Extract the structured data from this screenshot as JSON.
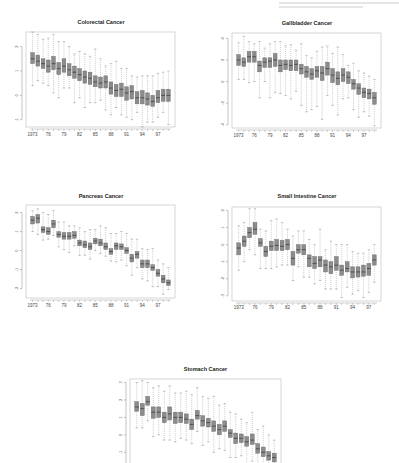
{
  "page": {
    "header_fragment": ""
  },
  "chart_data": [
    {
      "type": "boxplot",
      "title": "Colorectal Cancer",
      "categories": [
        "1973",
        "1974",
        "1975",
        "1976",
        "1977",
        "1978",
        "1979",
        "1980",
        "1981",
        "1982",
        "1983",
        "1984",
        "1985",
        "1986",
        "1987",
        "1988",
        "1989",
        "1990",
        "1991",
        "1992",
        "1993",
        "1994",
        "1995",
        "1996",
        "1997",
        "1998",
        "1999"
      ],
      "tick_labels": [
        "1973",
        "76",
        "79",
        "82",
        "85",
        "88",
        "91",
        "94",
        "97"
      ],
      "yticks": [
        -1,
        0,
        1,
        2
      ],
      "ylim": [
        -1.3,
        2.6
      ],
      "medians": [
        1.5,
        1.4,
        1.3,
        1.2,
        1.3,
        1.1,
        1.2,
        1.05,
        0.95,
        0.85,
        0.75,
        0.7,
        0.55,
        0.5,
        0.55,
        0.3,
        0.2,
        0.25,
        0.1,
        0.15,
        -0.1,
        -0.1,
        -0.15,
        -0.25,
        -0.1,
        0.0,
        0.0
      ],
      "q1": [
        1.3,
        1.2,
        1.1,
        0.95,
        1.05,
        0.85,
        0.95,
        0.8,
        0.7,
        0.6,
        0.5,
        0.45,
        0.35,
        0.3,
        0.3,
        0.05,
        -0.05,
        -0.05,
        -0.2,
        -0.15,
        -0.35,
        -0.35,
        -0.4,
        -0.45,
        -0.3,
        -0.25,
        -0.25
      ],
      "q3": [
        1.75,
        1.65,
        1.5,
        1.45,
        1.6,
        1.35,
        1.5,
        1.3,
        1.2,
        1.1,
        1.0,
        0.95,
        0.8,
        0.75,
        0.8,
        0.55,
        0.45,
        0.5,
        0.35,
        0.4,
        0.15,
        0.2,
        0.1,
        0.0,
        0.2,
        0.25,
        0.25
      ],
      "whisker_low": [
        0.4,
        0.6,
        0.5,
        0.4,
        0.1,
        -0.1,
        0.3,
        0.3,
        -0.3,
        -0.1,
        -0.5,
        -0.3,
        -0.3,
        -0.2,
        -0.6,
        -0.8,
        -0.5,
        -0.8,
        -0.9,
        -1.0,
        -0.7,
        -1.3,
        -1.1,
        -1.1,
        -0.9,
        -0.7,
        -1.2
      ],
      "whisker_high": [
        2.6,
        2.5,
        2.3,
        2.35,
        2.5,
        2.2,
        2.2,
        2.0,
        1.7,
        1.8,
        1.7,
        1.6,
        1.9,
        1.5,
        1.2,
        1.3,
        1.4,
        1.1,
        1.1,
        0.8,
        0.75,
        0.8,
        0.8,
        0.8,
        0.9,
        0.95,
        1.0
      ],
      "grid": false
    },
    {
      "type": "boxplot",
      "title": "Gallbladder Cancer",
      "categories": [
        "1973",
        "1974",
        "1975",
        "1976",
        "1977",
        "1978",
        "1979",
        "1980",
        "1981",
        "1982",
        "1983",
        "1984",
        "1985",
        "1986",
        "1987",
        "1988",
        "1989",
        "1990",
        "1991",
        "1992",
        "1993",
        "1994",
        "1995",
        "1996",
        "1997",
        "1998",
        "1999"
      ],
      "tick_labels": [
        "1973",
        "76",
        "79",
        "82",
        "85",
        "88",
        "91",
        "94",
        "97"
      ],
      "yticks": [
        -4,
        -2,
        0,
        2,
        4
      ],
      "ylim": [
        -4.3,
        4.5
      ],
      "medians": [
        2.0,
        1.8,
        2.3,
        2.3,
        1.5,
        1.8,
        1.9,
        2.0,
        1.5,
        1.6,
        1.5,
        1.6,
        1.2,
        0.9,
        0.7,
        1.0,
        0.8,
        1.2,
        0.6,
        0.3,
        0.6,
        0.4,
        -0.2,
        -0.6,
        -1.0,
        -1.1,
        -1.5
      ],
      "q1": [
        1.5,
        1.4,
        1.8,
        1.8,
        0.9,
        1.3,
        1.3,
        1.4,
        0.9,
        1.1,
        1.0,
        1.0,
        0.7,
        0.4,
        0.2,
        0.4,
        0.1,
        0.6,
        -0.1,
        -0.3,
        0.0,
        -0.2,
        -0.7,
        -1.2,
        -1.5,
        -1.6,
        -2.1
      ],
      "q3": [
        2.5,
        2.2,
        2.8,
        2.8,
        1.9,
        2.2,
        2.2,
        2.6,
        2.0,
        2.0,
        2.0,
        2.0,
        1.6,
        1.4,
        1.2,
        1.4,
        1.4,
        1.8,
        1.2,
        0.9,
        1.2,
        0.9,
        0.2,
        -0.2,
        -0.6,
        -0.7,
        -1.0
      ],
      "whisker_low": [
        0.2,
        0.2,
        -0.1,
        0.0,
        -1.5,
        0.0,
        -1.5,
        -1.0,
        -1.1,
        -1.3,
        -1.6,
        -0.9,
        -2.2,
        -2.8,
        -2.6,
        -2.3,
        -3.5,
        -1.3,
        -2.2,
        -3.1,
        -1.6,
        -1.5,
        -2.6,
        -3.3,
        -2.8,
        -3.2,
        -4.1
      ],
      "whisker_high": [
        3.6,
        4.2,
        3.7,
        3.5,
        3.7,
        3.1,
        3.5,
        3.7,
        3.7,
        3.3,
        3.4,
        2.9,
        3.5,
        2.4,
        2.2,
        2.8,
        3.2,
        3.3,
        2.6,
        3.2,
        2.5,
        1.5,
        1.7,
        1.0,
        0.8,
        0.5,
        0.2
      ],
      "grid": false
    },
    {
      "type": "boxplot",
      "title": "Pancreas Cancer",
      "categories": [
        "1973",
        "1974",
        "1975",
        "1976",
        "1977",
        "1978",
        "1979",
        "1980",
        "1981",
        "1982",
        "1983",
        "1984",
        "1985",
        "1986",
        "1987",
        "1988",
        "1989",
        "1990",
        "1991",
        "1992",
        "1993",
        "1994",
        "1995",
        "1996",
        "1997",
        "1998",
        "1999"
      ],
      "tick_labels": [
        "1973",
        "76",
        "79",
        "82",
        "85",
        "88",
        "91",
        "94",
        "97"
      ],
      "yticks": [
        -2,
        -1,
        0,
        1,
        2
      ],
      "ylim": [
        -2.5,
        2.4
      ],
      "medians": [
        1.6,
        1.7,
        1.1,
        1.0,
        1.4,
        0.85,
        0.75,
        0.75,
        0.8,
        0.4,
        0.3,
        0.2,
        0.5,
        0.4,
        0.2,
        -0.05,
        0.25,
        0.2,
        0.0,
        -0.4,
        -0.2,
        -0.7,
        -0.7,
        -0.9,
        -1.2,
        -1.5,
        -1.7
      ],
      "q1": [
        1.4,
        1.45,
        0.95,
        0.85,
        1.2,
        0.7,
        0.6,
        0.6,
        0.65,
        0.25,
        0.15,
        0.05,
        0.35,
        0.25,
        0.05,
        -0.2,
        0.05,
        0.05,
        -0.15,
        -0.6,
        -0.4,
        -0.9,
        -0.9,
        -1.05,
        -1.35,
        -1.7,
        -1.85
      ],
      "q3": [
        1.8,
        1.9,
        1.25,
        1.2,
        1.6,
        1.0,
        0.95,
        0.95,
        1.0,
        0.55,
        0.5,
        0.4,
        0.65,
        0.6,
        0.4,
        0.1,
        0.4,
        0.35,
        0.15,
        -0.2,
        -0.05,
        -0.5,
        -0.5,
        -0.75,
        -1.0,
        -1.3,
        -1.55
      ],
      "whisker_low": [
        1.0,
        0.85,
        0.55,
        0.6,
        0.8,
        0.2,
        0.05,
        -0.1,
        0.25,
        -0.25,
        -0.25,
        -0.45,
        0.0,
        -0.15,
        -0.3,
        -0.55,
        -0.6,
        -0.5,
        -0.8,
        -1.3,
        -0.9,
        -1.5,
        -1.6,
        -1.9,
        -1.9,
        -2.3,
        -2.05
      ],
      "whisker_high": [
        2.1,
        2.2,
        2.0,
        1.9,
        2.1,
        1.5,
        1.5,
        1.3,
        1.3,
        1.2,
        1.0,
        1.1,
        1.1,
        1.3,
        1.2,
        0.9,
        0.9,
        1.0,
        0.9,
        0.6,
        0.6,
        0.1,
        0.05,
        0.1,
        -0.5,
        -0.7,
        -0.9
      ],
      "grid": false
    },
    {
      "type": "boxplot",
      "title": "Small Intestine Cancer",
      "categories": [
        "1973",
        "1974",
        "1975",
        "1976",
        "1977",
        "1978",
        "1979",
        "1980",
        "1981",
        "1982",
        "1983",
        "1984",
        "1985",
        "1986",
        "1987",
        "1988",
        "1989",
        "1990",
        "1991",
        "1992",
        "1993",
        "1994",
        "1995",
        "1996",
        "1997",
        "1998",
        "1999"
      ],
      "tick_labels": [
        "1973",
        "76",
        "79",
        "82",
        "85",
        "88",
        "91",
        "94",
        "97"
      ],
      "yticks": [
        -3,
        -2,
        -1,
        0,
        1,
        2
      ],
      "ylim": [
        -3.3,
        2.2
      ],
      "medians": [
        -0.2,
        0.2,
        0.7,
        0.9,
        0.1,
        -0.4,
        -0.1,
        -0.05,
        -0.1,
        0.0,
        -0.8,
        -0.3,
        -0.3,
        -0.8,
        -1.1,
        -0.9,
        -1.2,
        -1.3,
        -1.2,
        -1.5,
        -1.4,
        -1.6,
        -1.6,
        -1.6,
        -1.4,
        -0.9
      ],
      "q1": [
        -0.6,
        -0.1,
        0.4,
        0.6,
        -0.1,
        -0.7,
        -0.35,
        -0.35,
        -0.35,
        -0.3,
        -1.2,
        -0.5,
        -0.6,
        -1.3,
        -1.4,
        -1.3,
        -1.6,
        -1.7,
        -1.5,
        -1.8,
        -1.6,
        -1.95,
        -1.9,
        -1.85,
        -1.8,
        -1.2
      ],
      "q3": [
        0.1,
        0.5,
        1.0,
        1.3,
        0.35,
        -0.1,
        0.2,
        0.3,
        0.25,
        0.3,
        -0.4,
        0.0,
        0.0,
        -0.6,
        -0.7,
        -0.7,
        -0.9,
        -1.0,
        -0.7,
        -1.2,
        -1.0,
        -1.3,
        -1.3,
        -1.2,
        -1.1,
        -0.6
      ],
      "whisker_low": [
        -1.5,
        -1.0,
        -0.3,
        -0.6,
        -1.4,
        -1.4,
        -1.4,
        -1.3,
        -1.2,
        -1.2,
        -2.1,
        -1.3,
        -1.9,
        -1.9,
        -2.3,
        -2.1,
        -2.6,
        -2.6,
        -2.6,
        -3.1,
        -2.5,
        -2.9,
        -2.7,
        -3.1,
        -2.8,
        -2.2
      ],
      "whisker_high": [
        1.1,
        1.3,
        2.1,
        2.1,
        0.9,
        0.8,
        1.4,
        1.5,
        1.3,
        0.9,
        0.5,
        0.8,
        0.8,
        0.3,
        0.0,
        0.9,
        -0.3,
        0.2,
        0.0,
        0.0,
        0.0,
        -0.4,
        -0.5,
        -0.5,
        -0.3,
        0.0
      ],
      "grid": false
    },
    {
      "type": "boxplot",
      "title": "Stomach Cancer",
      "categories": [
        "1973",
        "1974",
        "1975",
        "1976",
        "1977",
        "1978",
        "1979",
        "1980",
        "1981",
        "1982",
        "1983",
        "1984",
        "1985",
        "1986",
        "1987",
        "1988",
        "1989",
        "1990",
        "1991",
        "1992",
        "1993",
        "1994",
        "1995",
        "1996",
        "1997",
        "1998",
        "1999"
      ],
      "tick_labels": [
        "1973",
        "76",
        "79",
        "82",
        "85",
        "88",
        "91",
        "94",
        "97"
      ],
      "yticks": [
        -2,
        -1,
        0,
        1,
        2,
        3
      ],
      "ylim": [
        -2.3,
        3.2
      ],
      "medians": [
        1.6,
        1.5,
        1.9,
        1.3,
        1.3,
        1.0,
        1.2,
        1.0,
        1.0,
        0.9,
        0.6,
        1.1,
        0.8,
        0.7,
        0.5,
        0.3,
        0.5,
        0.1,
        -0.2,
        -0.2,
        -0.4,
        -0.3,
        -0.8,
        -1.0,
        -1.2,
        -1.3
      ],
      "q1": [
        1.35,
        1.1,
        1.7,
        0.95,
        1.0,
        0.7,
        0.85,
        0.65,
        0.7,
        0.65,
        0.3,
        0.9,
        0.5,
        0.45,
        0.2,
        0.0,
        0.2,
        -0.15,
        -0.5,
        -0.45,
        -0.65,
        -0.55,
        -1.05,
        -1.25,
        -1.45,
        -1.55
      ],
      "q3": [
        1.9,
        1.8,
        2.2,
        1.6,
        1.6,
        1.3,
        1.6,
        1.3,
        1.3,
        1.2,
        0.9,
        1.4,
        1.1,
        0.95,
        0.8,
        0.6,
        0.8,
        0.3,
        0.1,
        0.05,
        -0.1,
        0.05,
        -0.5,
        -0.7,
        -0.95,
        -1.05
      ],
      "whisker_low": [
        0.4,
        0.4,
        0.8,
        -0.1,
        0.0,
        -0.3,
        -0.3,
        -0.4,
        -0.2,
        -0.3,
        -0.5,
        0.2,
        -0.6,
        -0.4,
        -1.0,
        -0.8,
        -0.9,
        -1.3,
        -1.3,
        -1.2,
        -1.8,
        -1.5,
        -2.1,
        -2.1,
        -2.3,
        -2.3
      ],
      "whisker_high": [
        3.0,
        3.1,
        3.0,
        2.7,
        2.8,
        2.5,
        2.8,
        2.4,
        2.4,
        2.5,
        2.3,
        2.7,
        2.2,
        2.1,
        2.2,
        1.7,
        1.8,
        1.3,
        1.2,
        0.9,
        0.7,
        1.3,
        0.3,
        0.5,
        0.0,
        -0.3
      ],
      "grid": false
    }
  ]
}
